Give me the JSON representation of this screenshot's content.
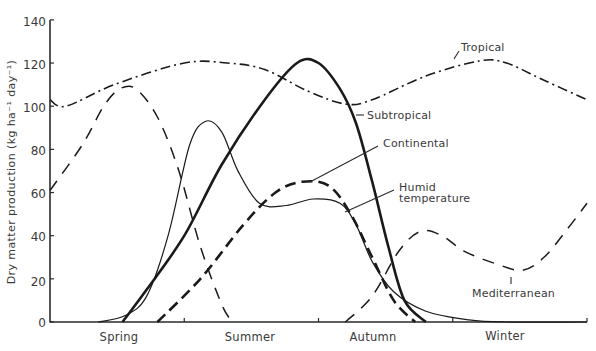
{
  "chart_data": {
    "type": "line",
    "title": "",
    "xlabel": "",
    "ylabel": "Dry matter production (kg ha⁻¹ day⁻¹)",
    "ylim": [
      0,
      140
    ],
    "xlim": [
      0,
      100
    ],
    "yticks": [
      0,
      20,
      40,
      60,
      80,
      100,
      120,
      140
    ],
    "categories": [
      "Spring",
      "Summer",
      "Autumn",
      "Winter"
    ],
    "category_positions": [
      12.5,
      37.5,
      62.5,
      87.5
    ],
    "x_tick_positions": [
      25,
      50,
      75,
      100
    ],
    "grid": false,
    "legend": "inline labels with leader lines",
    "colors": {
      "ink": "#1a1a1a",
      "axis": "#2a2a2a",
      "text": "#3a3a3a",
      "background": "#ffffff"
    },
    "series": [
      {
        "name": "Tropical",
        "style": "dashdot",
        "points": [
          [
            0,
            103
          ],
          [
            3,
            100
          ],
          [
            12,
            110
          ],
          [
            25,
            120
          ],
          [
            33,
            120
          ],
          [
            40,
            117
          ],
          [
            48,
            107
          ],
          [
            55,
            101
          ],
          [
            60,
            103
          ],
          [
            70,
            114
          ],
          [
            80,
            121
          ],
          [
            85,
            120
          ],
          [
            92,
            112
          ],
          [
            100,
            103
          ]
        ]
      },
      {
        "name": "Subtropical",
        "style": "thick-solid",
        "points": [
          [
            13.5,
            0
          ],
          [
            18,
            15
          ],
          [
            25,
            40
          ],
          [
            32,
            73
          ],
          [
            40,
            103
          ],
          [
            46,
            120
          ],
          [
            50,
            120
          ],
          [
            54,
            108
          ],
          [
            57,
            92
          ],
          [
            60,
            65
          ],
          [
            63,
            35
          ],
          [
            66,
            10
          ],
          [
            70,
            0
          ]
        ]
      },
      {
        "name": "Continental",
        "style": "thin-solid",
        "points": [
          [
            9,
            0
          ],
          [
            14,
            3
          ],
          [
            18,
            12
          ],
          [
            22,
            40
          ],
          [
            26,
            82
          ],
          [
            29,
            93
          ],
          [
            32,
            88
          ],
          [
            35,
            70
          ],
          [
            39,
            55
          ],
          [
            44,
            54
          ],
          [
            49,
            57
          ],
          [
            54,
            55
          ],
          [
            57,
            45
          ],
          [
            60,
            28
          ],
          [
            64,
            14
          ],
          [
            70,
            5
          ],
          [
            78,
            1
          ],
          [
            85,
            0
          ],
          [
            100,
            0
          ]
        ]
      },
      {
        "name": "Humid temperature",
        "style": "thick-dashed",
        "points": [
          [
            20,
            0
          ],
          [
            28,
            20
          ],
          [
            36,
            45
          ],
          [
            42,
            60
          ],
          [
            47,
            65
          ],
          [
            52,
            63
          ],
          [
            56,
            50
          ],
          [
            60,
            30
          ],
          [
            64,
            10
          ],
          [
            68,
            0
          ]
        ]
      },
      {
        "name": "Mediterranean",
        "style": "dashed",
        "points": [
          [
            0,
            61
          ],
          [
            6,
            82
          ],
          [
            10,
            100
          ],
          [
            13,
            108
          ],
          [
            16,
            108
          ],
          [
            20,
            95
          ],
          [
            24,
            70
          ],
          [
            28,
            35
          ],
          [
            32,
            8
          ],
          [
            34,
            0
          ]
        ],
        "points_autumn_winter": [
          [
            55,
            0
          ],
          [
            60,
            12
          ],
          [
            65,
            33
          ],
          [
            69,
            42
          ],
          [
            73,
            40
          ],
          [
            77,
            33
          ],
          [
            83,
            27
          ],
          [
            88,
            24
          ],
          [
            92,
            30
          ],
          [
            96,
            42
          ],
          [
            100,
            55
          ]
        ]
      }
    ],
    "annotations": [
      {
        "text": "Tropical",
        "series": "Tropical"
      },
      {
        "text": "Subtropical",
        "series": "Subtropical"
      },
      {
        "text": "Continental",
        "series": "Continental"
      },
      {
        "text": "Humid",
        "series": "Humid temperature"
      },
      {
        "text": "temperature",
        "series": "Humid temperature"
      },
      {
        "text": "Mediterranean",
        "series": "Mediterranean"
      }
    ]
  },
  "labels": {
    "ylabel": "Dry matter production (kg ha⁻¹ day⁻¹)",
    "ticks": [
      "0",
      "20",
      "40",
      "60",
      "80",
      "100",
      "120",
      "140"
    ],
    "seasons": [
      "Spring",
      "Summer",
      "Autumn",
      "Winter"
    ],
    "tropical": "Tropical",
    "subtropical": "Subtropical",
    "continental": "Continental",
    "humid_line1": "Humid",
    "humid_line2": "temperature",
    "mediterranean": "Mediterranean"
  }
}
